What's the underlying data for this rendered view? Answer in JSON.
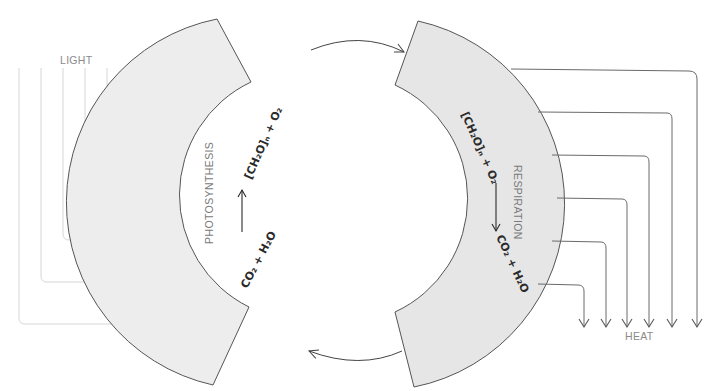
{
  "diagram": {
    "light_label": "LIGHT",
    "heat_label": "HEAT",
    "photosynthesis": {
      "label": "PHOTOSYNTHESIS",
      "reactants": "CO₂ + H₂O",
      "products": "[CH₂O]ₙ + O₂"
    },
    "respiration": {
      "label": "RESPIRATION",
      "reactants": "[CH₂O]ₙ + O₂",
      "products": "CO₂ + H₂O"
    },
    "colors": {
      "arc_fill": "#ececec",
      "arc_fill_right": "#e6e6e6",
      "arc_stroke": "#555555",
      "light_arrow": "#d4d4d4",
      "heat_arrow": "#6a6a6a",
      "cycle_arrow": "#444444"
    },
    "light_arrow_count": 6,
    "heat_arrow_count": 6
  }
}
